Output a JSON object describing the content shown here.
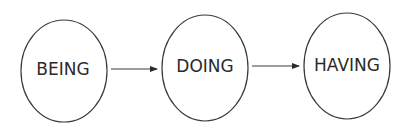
{
  "diagram": {
    "type": "flow",
    "direction": "left-to-right",
    "colors": {
      "background": "#ffffff",
      "stroke": "#3a3a3a",
      "text": "#2a2a2a"
    },
    "nodes": [
      {
        "id": "being",
        "label": "BEING",
        "shape": "ellipse",
        "cx": 64,
        "cy": 71,
        "rx": 43,
        "ry": 51
      },
      {
        "id": "doing",
        "label": "DOING",
        "shape": "ellipse",
        "cx": 205,
        "cy": 68,
        "rx": 43,
        "ry": 53
      },
      {
        "id": "having",
        "label": "HAVING",
        "shape": "ellipse",
        "cx": 347,
        "cy": 66,
        "rx": 43,
        "ry": 53
      }
    ],
    "edges": [
      {
        "from": "being",
        "to": "doing",
        "x1": 111,
        "y1": 69,
        "x2": 157,
        "y2": 69
      },
      {
        "from": "doing",
        "to": "having",
        "x1": 252,
        "y1": 66,
        "x2": 299,
        "y2": 66
      }
    ]
  }
}
